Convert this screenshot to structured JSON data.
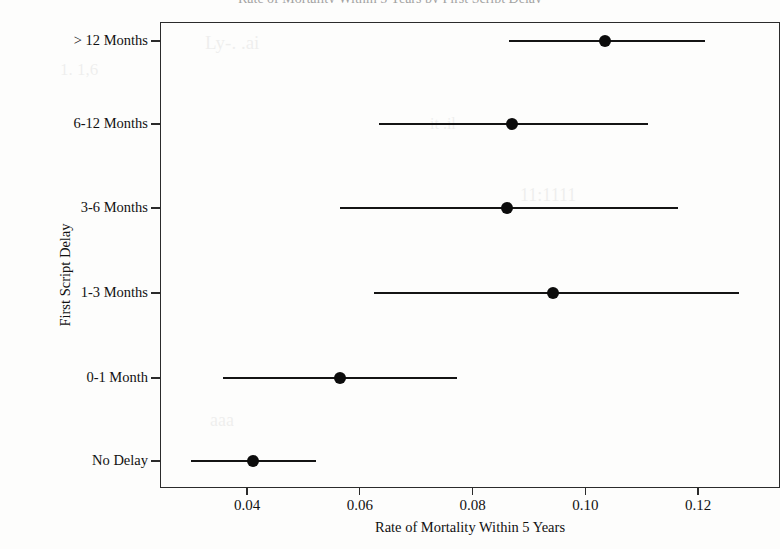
{
  "chart_title": "Rate of Mortality Within 5 Years by First Script Delay",
  "axes": {
    "y_title": "First Script Delay",
    "x_title": "Rate of Mortality Within 5 Years",
    "x_ticks": [
      "0.04",
      "0.06",
      "0.08",
      "0.10",
      "0.12"
    ],
    "y_categories": [
      "> 12 Months",
      "6-12 Months",
      "3-6 Months",
      "1-3 Months",
      "0-1 Month",
      "No Delay"
    ]
  },
  "ghost_text": [
    "1. 1,6",
    "Ly-. .ai",
    "it .il",
    "11:1111",
    "aaa"
  ],
  "chart_data": {
    "type": "scatter",
    "title": "Rate of Mortality Within 5 Years by First Script Delay",
    "xlabel": "Rate of Mortality Within 5 Years",
    "ylabel": "First Script Delay",
    "orientation": "horizontal",
    "error_bars": "confidence-interval",
    "grid": false,
    "legend": "none",
    "xlim": [
      0.028,
      0.13
    ],
    "xticks": [
      0.04,
      0.06,
      0.08,
      0.1,
      0.12
    ],
    "categories": [
      "> 12 Months",
      "6-12 Months",
      "3-6 Months",
      "1-3 Months",
      "0-1 Month",
      "No Delay"
    ],
    "values": [
      0.1035,
      0.087,
      0.0862,
      0.0942,
      0.0565,
      0.041
    ],
    "ci_low": [
      0.0865,
      0.0635,
      0.0565,
      0.0625,
      0.0358,
      0.03
    ],
    "ci_high": [
      0.1212,
      0.1112,
      0.1165,
      0.1272,
      0.0772,
      0.0522
    ],
    "points": [
      {
        "category": "> 12 Months",
        "estimate": 0.1035,
        "ci_low": 0.0865,
        "ci_high": 0.1212
      },
      {
        "category": "6-12 Months",
        "estimate": 0.087,
        "ci_low": 0.0635,
        "ci_high": 0.1112
      },
      {
        "category": "3-6 Months",
        "estimate": 0.0862,
        "ci_low": 0.0565,
        "ci_high": 0.1165
      },
      {
        "category": "1-3 Months",
        "estimate": 0.0942,
        "ci_low": 0.0625,
        "ci_high": 0.1272
      },
      {
        "category": "0-1 Month",
        "estimate": 0.0565,
        "ci_low": 0.0358,
        "ci_high": 0.0772
      },
      {
        "category": "No Delay",
        "estimate": 0.041,
        "ci_low": 0.03,
        "ci_high": 0.0522
      }
    ]
  },
  "colors": {
    "marker": "#0c0c0c",
    "line": "#141414",
    "axis": "#2b2b2b",
    "background": "#fdfdfc"
  }
}
